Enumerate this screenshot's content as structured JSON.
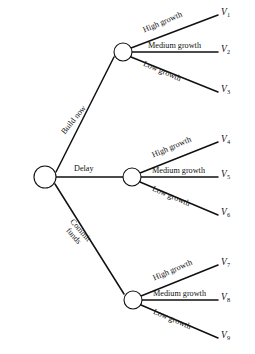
{
  "diagram": {
    "type": "decision-tree",
    "stroke_color": "#111111",
    "background_color": "#ffffff",
    "root_node": {
      "kind": "decision-node",
      "shape": "circle",
      "cx": 45,
      "cy": 177,
      "r": 11
    },
    "decision_branches": [
      {
        "id": "build-now",
        "label": "Build now",
        "label_lines": [
          "Build now"
        ],
        "orientation": "up",
        "rotation_deg": -51,
        "label_x": 60,
        "label_y": 131,
        "from": {
          "x": 56,
          "y": 172
        },
        "to": {
          "x": 114,
          "y": 57
        }
      },
      {
        "id": "delay",
        "label": "Delay",
        "label_lines": [
          "Delay"
        ],
        "orientation": "horizontal",
        "rotation_deg": 0,
        "label_x": 74,
        "label_y": 165,
        "from": {
          "x": 56,
          "y": 177
        },
        "to": {
          "x": 123,
          "y": 177
        }
      },
      {
        "id": "commit-funds",
        "label": "Commit funds",
        "label_lines": [
          "Commit",
          "funds"
        ],
        "orientation": "down",
        "rotation_deg": 49,
        "label_x": 72,
        "label_y": 215,
        "from": {
          "x": 55,
          "y": 184
        },
        "to": {
          "x": 124,
          "y": 294
        }
      }
    ],
    "chance_nodes": [
      {
        "id": "chance-node-build-now",
        "parent": "build-now",
        "shape": "circle",
        "cx": 123,
        "cy": 52,
        "r": 9,
        "outcomes": [
          {
            "id": "v1",
            "branch_label": "High growth",
            "outcome_label": "V",
            "outcome_subscript": "1",
            "rotation_deg": -23,
            "label_x": 142,
            "label_y": 27,
            "from": {
              "x": 131,
              "y": 48
            },
            "to": {
              "x": 218,
              "y": 15
            },
            "value_x": 221,
            "value_y": 8
          },
          {
            "id": "v2",
            "branch_label": "Medium growth",
            "outcome_label": "V",
            "outcome_subscript": "2",
            "rotation_deg": 0,
            "label_x": 148,
            "label_y": 42,
            "from": {
              "x": 132,
              "y": 52
            },
            "to": {
              "x": 218,
              "y": 52
            },
            "value_x": 221,
            "value_y": 45
          },
          {
            "id": "v3",
            "branch_label": "Low growth",
            "outcome_label": "V",
            "outcome_subscript": "3",
            "rotation_deg": 23,
            "label_x": 145,
            "label_y": 60,
            "from": {
              "x": 131,
              "y": 57
            },
            "to": {
              "x": 218,
              "y": 92
            },
            "value_x": 221,
            "value_y": 85
          }
        ]
      },
      {
        "id": "chance-node-delay",
        "parent": "delay",
        "shape": "circle",
        "cx": 132,
        "cy": 177,
        "r": 9,
        "outcomes": [
          {
            "id": "v4",
            "branch_label": "High growth",
            "outcome_label": "V",
            "outcome_subscript": "4",
            "rotation_deg": -23,
            "label_x": 151,
            "label_y": 152,
            "from": {
              "x": 140,
              "y": 173
            },
            "to": {
              "x": 218,
              "y": 142
            },
            "value_x": 221,
            "value_y": 135
          },
          {
            "id": "v5",
            "branch_label": "Medium growth",
            "outcome_label": "V",
            "outcome_subscript": "5",
            "rotation_deg": 0,
            "label_x": 152,
            "label_y": 167,
            "from": {
              "x": 141,
              "y": 177
            },
            "to": {
              "x": 218,
              "y": 177
            },
            "value_x": 221,
            "value_y": 170
          },
          {
            "id": "v6",
            "branch_label": "Low growth",
            "outcome_label": "V",
            "outcome_subscript": "6",
            "rotation_deg": 23,
            "label_x": 154,
            "label_y": 185,
            "from": {
              "x": 140,
              "y": 182
            },
            "to": {
              "x": 218,
              "y": 215
            },
            "value_x": 221,
            "value_y": 208
          }
        ]
      },
      {
        "id": "chance-node-commit-funds",
        "parent": "commit-funds",
        "shape": "circle",
        "cx": 133,
        "cy": 300,
        "r": 9,
        "outcomes": [
          {
            "id": "v7",
            "branch_label": "High growth",
            "outcome_label": "V",
            "outcome_subscript": "7",
            "rotation_deg": -23,
            "label_x": 152,
            "label_y": 275,
            "from": {
              "x": 141,
              "y": 296
            },
            "to": {
              "x": 218,
              "y": 265
            },
            "value_x": 221,
            "value_y": 258
          },
          {
            "id": "v8",
            "branch_label": "Medium growth",
            "outcome_label": "V",
            "outcome_subscript": "8",
            "rotation_deg": 0,
            "label_x": 153,
            "label_y": 290,
            "from": {
              "x": 142,
              "y": 300
            },
            "to": {
              "x": 218,
              "y": 300
            },
            "value_x": 221,
            "value_y": 293
          },
          {
            "id": "v9",
            "branch_label": "Low growth",
            "outcome_label": "V",
            "outcome_subscript": "9",
            "rotation_deg": 23,
            "label_x": 155,
            "label_y": 308,
            "from": {
              "x": 141,
              "y": 305
            },
            "to": {
              "x": 218,
              "y": 338
            },
            "value_x": 221,
            "value_y": 331
          }
        ]
      }
    ]
  }
}
